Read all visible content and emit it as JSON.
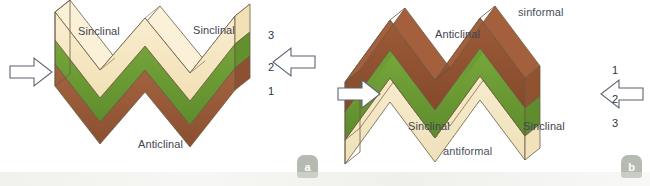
{
  "figure": {
    "background_color": "#ffffff"
  },
  "colors": {
    "layer_cream": "#f5e3bb",
    "layer_cream_light": "#faeed0",
    "layer_green": "#6d9b34",
    "layer_green_dark": "#5c8a2b",
    "layer_brown": "#9d5b38",
    "layer_brown_dark": "#7e4529",
    "outline": "#6b5a42",
    "label_text": "#3f4550",
    "arrow_stroke": "#5c6370",
    "badge_bg": "#a7ada1"
  },
  "panels": [
    {
      "id": "a",
      "badge_label": "a",
      "stratigraphy": "normal",
      "labels": [
        {
          "name": "syncline-left",
          "text": "Sinclinal",
          "x": 78,
          "y": 26
        },
        {
          "name": "syncline-right",
          "text": "Sinclinal",
          "x": 193,
          "y": 25
        },
        {
          "name": "anticline-bottom",
          "text": "Anticlinal",
          "x": 138,
          "y": 139
        }
      ],
      "layer_numbers": [
        {
          "name": "layer-number-3",
          "text": "3",
          "x": 268,
          "y": 30
        },
        {
          "name": "layer-number-2",
          "text": "2",
          "x": 268,
          "y": 62
        },
        {
          "name": "layer-number-1",
          "text": "1",
          "x": 268,
          "y": 86
        }
      ],
      "arrows": [
        {
          "name": "compression-arrow-left",
          "direction": "right"
        },
        {
          "name": "compression-arrow-right",
          "direction": "left"
        }
      ]
    },
    {
      "id": "b",
      "badge_label": "b",
      "stratigraphy": "inverted",
      "labels": [
        {
          "name": "sinformal-top",
          "text": "sinformal",
          "x": 193,
          "y": 7
        },
        {
          "name": "anticline-top",
          "text": "Anticlinal",
          "x": 110,
          "y": 29
        },
        {
          "name": "syncline-left",
          "text": "Sinclinal",
          "x": 83,
          "y": 121
        },
        {
          "name": "syncline-right",
          "text": "Sinclinal",
          "x": 198,
          "y": 121
        },
        {
          "name": "antiformal-bottom",
          "text": "antiformal",
          "x": 118,
          "y": 146
        }
      ],
      "layer_numbers": [
        {
          "name": "layer-number-1",
          "text": "1",
          "x": 287,
          "y": 65
        },
        {
          "name": "layer-number-2",
          "text": "2",
          "x": 287,
          "y": 94
        },
        {
          "name": "layer-number-3",
          "text": "3",
          "x": 287,
          "y": 118
        }
      ],
      "arrows": [
        {
          "name": "compression-arrow-left",
          "direction": "right"
        },
        {
          "name": "compression-arrow-right",
          "direction": "left"
        }
      ]
    }
  ]
}
